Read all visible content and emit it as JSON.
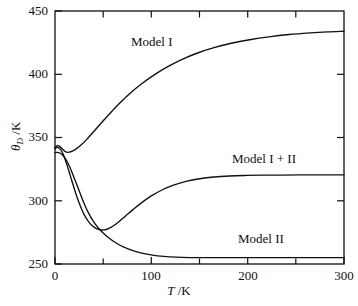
{
  "chart_data": {
    "type": "line",
    "title": "",
    "xlabel": "T /K",
    "ylabel": "θ_D /K",
    "xlim": [
      0,
      300
    ],
    "ylim": [
      250,
      450
    ],
    "xticks": [
      0,
      100,
      200,
      300
    ],
    "xtick_labels": [
      "0",
      "100",
      "200",
      "300"
    ],
    "xminor_ticks": [
      50,
      150,
      250
    ],
    "yticks": [
      250,
      300,
      350,
      400,
      450
    ],
    "ytick_labels": [
      "250",
      "300",
      "350",
      "400",
      "450"
    ],
    "grid": false,
    "legend": "inline-annotations",
    "series": [
      {
        "name": "Model I",
        "label": "Model I",
        "color": "#101010",
        "points": [
          [
            0,
            342.0
          ],
          [
            1.5,
            343.2
          ],
          [
            3,
            343.6
          ],
          [
            4.5,
            343.2
          ],
          [
            6,
            342.2
          ],
          [
            8,
            340.6
          ],
          [
            10,
            339.2
          ],
          [
            12,
            338.4
          ],
          [
            15,
            338.4
          ],
          [
            18,
            339.2
          ],
          [
            22,
            341.0
          ],
          [
            27,
            344.0
          ],
          [
            33,
            348.5
          ],
          [
            40,
            354.5
          ],
          [
            48,
            361.5
          ],
          [
            57,
            369.0
          ],
          [
            67,
            377.0
          ],
          [
            78,
            385.0
          ],
          [
            90,
            392.5
          ],
          [
            103,
            399.5
          ],
          [
            117,
            406.0
          ],
          [
            132,
            411.8
          ],
          [
            148,
            416.8
          ],
          [
            165,
            421.0
          ],
          [
            183,
            424.5
          ],
          [
            202,
            427.3
          ],
          [
            222,
            429.6
          ],
          [
            243,
            431.4
          ],
          [
            265,
            432.7
          ],
          [
            283,
            433.5
          ],
          [
            300,
            434.0
          ]
        ]
      },
      {
        "name": "Model I + II",
        "label": "Model I + II",
        "color": "#101010",
        "points": [
          [
            0,
            341.0
          ],
          [
            1.5,
            342.0
          ],
          [
            3,
            342.2
          ],
          [
            4.5,
            341.5
          ],
          [
            6,
            340.2
          ],
          [
            8,
            337.5
          ],
          [
            10,
            333.8
          ],
          [
            13,
            327.0
          ],
          [
            16,
            319.5
          ],
          [
            19,
            312.0
          ],
          [
            23,
            302.5
          ],
          [
            27,
            294.5
          ],
          [
            31,
            288.0
          ],
          [
            35,
            283.3
          ],
          [
            39,
            280.0
          ],
          [
            43,
            278.0
          ],
          [
            47,
            277.0
          ],
          [
            51,
            277.0
          ],
          [
            55,
            277.8
          ],
          [
            60,
            279.8
          ],
          [
            66,
            283.2
          ],
          [
            73,
            287.8
          ],
          [
            81,
            293.0
          ],
          [
            90,
            298.5
          ],
          [
            100,
            303.8
          ],
          [
            111,
            308.5
          ],
          [
            123,
            312.3
          ],
          [
            136,
            315.3
          ],
          [
            150,
            317.4
          ],
          [
            165,
            318.8
          ],
          [
            181,
            319.6
          ],
          [
            198,
            320.0
          ],
          [
            216,
            320.2
          ],
          [
            235,
            320.3
          ],
          [
            255,
            320.4
          ],
          [
            277,
            320.4
          ],
          [
            300,
            320.4
          ]
        ]
      },
      {
        "name": "Model II",
        "label": "Model II",
        "color": "#101010",
        "points": [
          [
            0,
            338.0
          ],
          [
            2,
            338.2
          ],
          [
            4,
            338.0
          ],
          [
            6,
            337.2
          ],
          [
            9,
            335.2
          ],
          [
            12,
            331.8
          ],
          [
            15,
            327.2
          ],
          [
            19,
            319.8
          ],
          [
            23,
            312.0
          ],
          [
            27,
            304.0
          ],
          [
            31,
            296.5
          ],
          [
            35,
            290.0
          ],
          [
            40,
            283.5
          ],
          [
            45,
            278.5
          ],
          [
            50,
            274.5
          ],
          [
            56,
            270.5
          ],
          [
            63,
            266.8
          ],
          [
            71,
            263.5
          ],
          [
            80,
            260.8
          ],
          [
            90,
            258.6
          ],
          [
            101,
            257.0
          ],
          [
            113,
            256.0
          ],
          [
            126,
            255.4
          ],
          [
            140,
            255.1
          ],
          [
            156,
            255.0
          ],
          [
            175,
            255.0
          ],
          [
            196,
            255.0
          ],
          [
            220,
            255.0
          ],
          [
            246,
            255.0
          ],
          [
            273,
            255.0
          ],
          [
            300,
            255.0
          ]
        ]
      }
    ],
    "annotations": [
      {
        "text": "Model I",
        "x": 95,
        "y": 424
      },
      {
        "text": "Model I + II",
        "x": 228,
        "y": 332
      },
      {
        "text": "Model II",
        "x": 228,
        "y": 268
      }
    ]
  },
  "axes": {
    "x_title_symbol": "T",
    "x_title_unit": "/K",
    "y_title_symbol": "θ",
    "y_title_subscript": "D",
    "y_title_unit": "/K",
    "y_labels": {
      "t450": "450",
      "t400": "400",
      "t350": "350",
      "t300": "300",
      "t250": "250"
    },
    "x_labels": {
      "t0": "0",
      "t100": "100",
      "t200": "200",
      "t300": "300"
    }
  },
  "labels": {
    "model_1": "Model I",
    "model_1_plus_2": "Model I + II",
    "model_2": "Model II"
  },
  "style": {
    "line_color": "#101010",
    "axis_color": "#101010",
    "background": "#ffffff"
  }
}
